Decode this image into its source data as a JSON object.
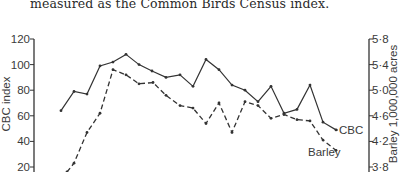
{
  "caption": "measured as the Common Birds Census index.",
  "chart_data": {
    "type": "line",
    "title": "",
    "xlabel": "",
    "ylabel": "CBC index",
    "y2label": "Barley 1,000,000 acres",
    "ylim": [
      20,
      120
    ],
    "y2lim": [
      3.8,
      5.8
    ],
    "yticks": [
      "120",
      "100",
      "80",
      "60",
      "40",
      "20"
    ],
    "y2ticks": [
      "5·8",
      "5·4",
      "5·0",
      "4·6",
      "4·2",
      "3·8"
    ],
    "grid": false,
    "legend": "inline labels at line ends",
    "x_points": 22,
    "series": [
      {
        "name": "CBC",
        "axis": "left",
        "style": "solid",
        "x_px": [
          61,
          74,
          87,
          100,
          113,
          126,
          139,
          152,
          166,
          180,
          193,
          206,
          219,
          232,
          245,
          258,
          271,
          284,
          297,
          310,
          323,
          336
        ],
        "values": [
          64,
          79,
          77,
          99,
          102,
          108,
          100,
          95,
          90,
          92,
          83,
          104,
          96,
          84,
          80,
          71,
          83,
          62,
          65,
          84,
          55,
          49
        ]
      },
      {
        "name": "Barley",
        "axis": "right",
        "style": "dashed",
        "x_px": [
          67,
          74,
          87,
          100,
          113,
          126,
          139,
          153,
          166,
          180,
          193,
          206,
          219,
          232,
          245,
          258,
          271,
          284,
          297,
          310,
          323,
          336
        ],
        "values": [
          3.72,
          3.86,
          4.34,
          4.64,
          5.32,
          5.24,
          5.1,
          5.12,
          4.92,
          4.76,
          4.72,
          4.48,
          4.8,
          4.34,
          4.82,
          4.76,
          4.56,
          4.62,
          4.54,
          4.52,
          4.22,
          4.06
        ]
      }
    ]
  }
}
